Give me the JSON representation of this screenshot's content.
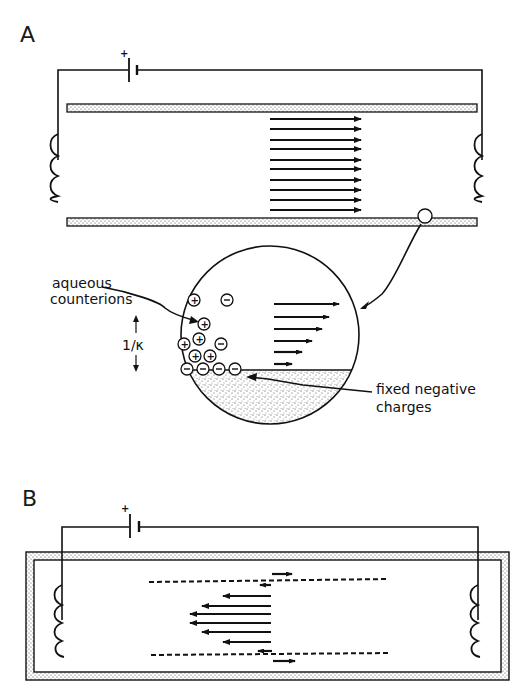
{
  "figure": {
    "panels": [
      {
        "id": "A",
        "label": "A",
        "battery": {
          "polarity_label": "+"
        },
        "flow_arrows": {
          "count": 10,
          "direction": "right",
          "profile": "plug"
        },
        "magnifier": {
          "annotations": {
            "counterions": [
              "aqueous",
              "counterions"
            ],
            "debye_length": "1/κ",
            "fixed_charges": [
              "fixed negative",
              "charges"
            ]
          },
          "ions": {
            "positive_symbol": "+",
            "negative_symbol": "−",
            "positive_count": 7,
            "negative_free_count": 2,
            "negative_fixed_count": 4
          },
          "flow_arrows": {
            "count": 6,
            "direction": "right",
            "lengths": [
              62,
              52,
              46,
              36,
              26,
              16
            ]
          }
        }
      },
      {
        "id": "B",
        "label": "B",
        "battery": {
          "polarity_label": "+"
        },
        "flow_arrows": {
          "wall_flow": "right",
          "center_flow": "left",
          "count_center": 6,
          "profile": "parabolic backflow"
        }
      }
    ]
  },
  "colors": {
    "ink": "#111111",
    "background": "#ffffff",
    "stipple": "#555555"
  }
}
